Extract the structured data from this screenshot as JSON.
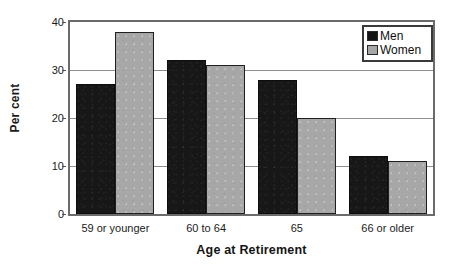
{
  "chart_data": {
    "type": "bar",
    "title": "",
    "xlabel": "Age at Retirement",
    "ylabel": "Per cent",
    "categories": [
      "59 or younger",
      "60 to 64",
      "65",
      "66 or older"
    ],
    "series": [
      {
        "name": "Men",
        "values": [
          27,
          32,
          28,
          12
        ],
        "color": "#171717"
      },
      {
        "name": "Women",
        "values": [
          38,
          31,
          20,
          11
        ],
        "color": "#a7a7a7"
      }
    ],
    "ylim": [
      0,
      40
    ],
    "yticks": [
      0,
      10,
      20,
      30,
      40
    ],
    "ytick_labels": [
      "0",
      "10",
      "20",
      "30",
      "40"
    ],
    "grid": true,
    "grid_axis": "y",
    "legend_position": "top-right",
    "legend_entries": [
      "Men",
      "Women"
    ],
    "bar_orientation": "vertical",
    "group_mode": "clustered"
  },
  "axes": {
    "y_title": "Per cent",
    "x_title": "Age at Retirement"
  },
  "legend": {
    "items": [
      {
        "label": "Men",
        "swatch": "black-square-icon"
      },
      {
        "label": "Women",
        "swatch": "gray-square-icon"
      }
    ]
  },
  "colors": {
    "men_bar": "#171717",
    "women_bar": "#a7a7a7",
    "gridline": "#8d8d8d",
    "frame": "#6b6b6b",
    "text": "#1a1a1a",
    "background": "#ffffff"
  }
}
